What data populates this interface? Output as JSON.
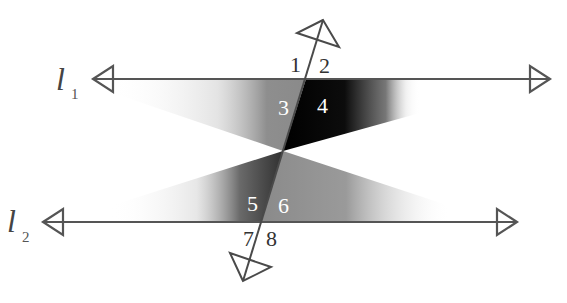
{
  "diagram": {
    "lines": {
      "l1": {
        "name": "l",
        "subscript": "1",
        "y": 79,
        "x_start": 92,
        "x_end": 551
      },
      "l2": {
        "name": "l",
        "subscript": "2",
        "y": 222,
        "x_start": 42,
        "x_end": 518
      }
    },
    "transversal": {
      "top": [
        323,
        20
      ],
      "bottom": [
        243,
        281
      ]
    },
    "angles": [
      {
        "label": "1",
        "color": "#333333"
      },
      {
        "label": "2",
        "color": "#333333"
      },
      {
        "label": "3",
        "color": "#ffffff"
      },
      {
        "label": "4",
        "color": "#ffffff"
      },
      {
        "label": "5",
        "color": "#ffffff"
      },
      {
        "label": "6",
        "color": "#ffffff"
      },
      {
        "label": "7",
        "color": "#333333"
      },
      {
        "label": "8",
        "color": "#333333"
      }
    ],
    "colors": {
      "line": "#555555",
      "shade_light": "#9a9a9a",
      "shade_dark": "#0a0a0a",
      "background": "#ffffff"
    }
  }
}
